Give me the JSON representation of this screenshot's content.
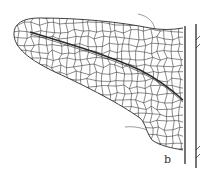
{
  "figure": {
    "panel_label": "b",
    "colors": {
      "ink": "#2a2a2a",
      "background": "#ffffff"
    }
  }
}
